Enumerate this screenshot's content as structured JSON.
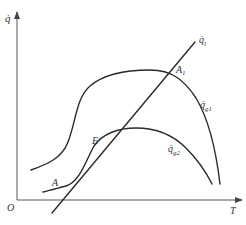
{
  "diagram": {
    "type": "heat-balance-plot",
    "colors": {
      "line": "#2a2a2a",
      "axis": "#555555",
      "text": "#333333",
      "background": "#ffffff"
    },
    "axes": {
      "y_label": "q̇",
      "x_label": "T",
      "origin_label": "O"
    },
    "curves": [
      {
        "id": "heat-loss-line",
        "label_main": "q̇",
        "label_sub": "l"
      },
      {
        "id": "heat-gen-curve-1",
        "label_main": "q̇",
        "label_sub": "g1"
      },
      {
        "id": "heat-gen-curve-2",
        "label_main": "q̇",
        "label_sub": "g2"
      }
    ],
    "points": [
      {
        "id": "A1",
        "label_main": "A",
        "label_sub": "1"
      },
      {
        "id": "E",
        "label_main": "E",
        "label_sub": ""
      },
      {
        "id": "A",
        "label_main": "A",
        "label_sub": ""
      }
    ]
  }
}
